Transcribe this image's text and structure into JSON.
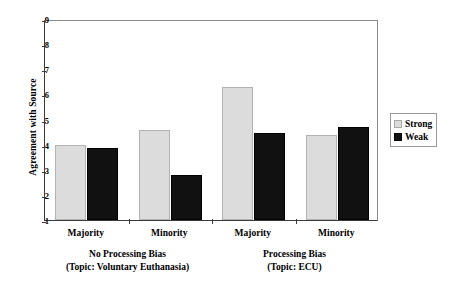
{
  "chart_data": {
    "type": "bar",
    "title": "",
    "xlabel": "",
    "ylabel": "Agreement with Source",
    "ylim": [
      1,
      9
    ],
    "yticks": [
      1,
      2,
      3,
      4,
      5,
      6,
      7,
      8,
      9
    ],
    "grid": false,
    "legend_position": "right",
    "categories": [
      "Majority",
      "Minority",
      "Majority",
      "Minority"
    ],
    "groups": [
      {
        "label_line1": "No Processing Bias",
        "label_line2": "(Topic: Voluntary Euthanasia)",
        "categories": [
          "Majority",
          "Minority"
        ]
      },
      {
        "label_line1": "Processing Bias",
        "label_line2": "(Topic: ECU)",
        "categories": [
          "Majority",
          "Minority"
        ]
      }
    ],
    "series": [
      {
        "name": "Strong",
        "color": "#dcdcdc",
        "values": [
          4.0,
          4.6,
          6.3,
          4.4
        ]
      },
      {
        "name": "Weak",
        "color": "#111111",
        "values": [
          3.85,
          2.8,
          4.45,
          4.7
        ]
      }
    ]
  },
  "axis": {
    "y_title": "Agreement with Source",
    "y_tick_labels": [
      "9",
      "8",
      "7",
      "6",
      "5",
      "4",
      "3",
      "2",
      "1"
    ]
  },
  "legend": {
    "entries": [
      {
        "label": "Strong",
        "color": "#dcdcdc"
      },
      {
        "label": "Weak",
        "color": "#111111"
      }
    ]
  }
}
